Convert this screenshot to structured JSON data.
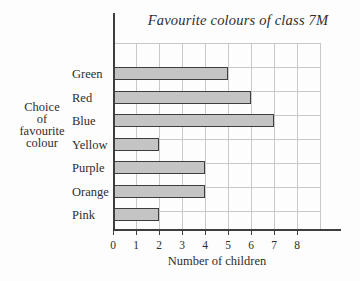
{
  "chart_data": {
    "type": "bar",
    "orientation": "horizontal",
    "title": "Favourite colours of class 7M",
    "categories": [
      "Green",
      "Red",
      "Blue",
      "Yellow",
      "Purple",
      "Orange",
      "Pink"
    ],
    "values": [
      5,
      6,
      7,
      2,
      4,
      4,
      2
    ],
    "xlabel": "Number of children",
    "ylabel": "Choice of favourite colour",
    "ylabel_lines": [
      "Choice",
      "of",
      "favourite",
      "colour"
    ],
    "xlim": [
      0,
      9
    ],
    "xticks": [
      "0",
      "1",
      "2",
      "3",
      "4",
      "5",
      "6",
      "7",
      "8"
    ],
    "grid": true,
    "legend": false,
    "colors": {
      "background": "#fdfdfd",
      "bar_fill": "#c4c4c4",
      "bar_border": "#3e3e3e",
      "grid": "#c9c9c9",
      "axis": "#3e3e3e",
      "text": "#2e2e2e"
    }
  }
}
